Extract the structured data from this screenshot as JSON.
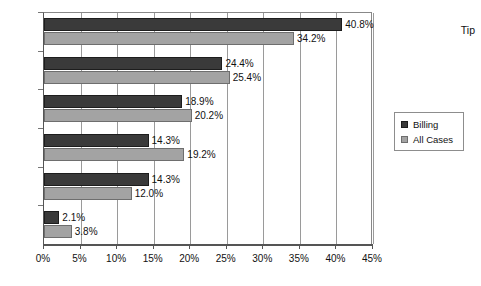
{
  "chart_data": {
    "type": "bar",
    "orientation": "horizontal",
    "title": "",
    "xlabel": "",
    "ylabel": "",
    "xlim": [
      0,
      45
    ],
    "xticks": [
      "0%",
      "5%",
      "10%",
      "15%",
      "20%",
      "25%",
      "30%",
      "35%",
      "40%",
      "45%"
    ],
    "xtick_values": [
      0,
      5,
      10,
      15,
      20,
      25,
      30,
      35,
      40,
      45
    ],
    "grid": true,
    "grid_axis": "x",
    "legend_position": "right",
    "categories": [
      "Tip",
      "",
      "",
      "",
      "",
      ""
    ],
    "series": [
      {
        "name": "Billing",
        "color": "#3a3a3a",
        "values": [
          40.8,
          24.4,
          18.9,
          14.3,
          14.3,
          2.1
        ],
        "labels": [
          "40.8%",
          "24.4%",
          "18.9%",
          "14.3%",
          "14.3%",
          "2.1%"
        ]
      },
      {
        "name": "All Cases",
        "color": "#a3a3a3",
        "values": [
          34.2,
          25.4,
          20.2,
          19.2,
          12.0,
          3.8
        ],
        "labels": [
          "34.2%",
          "25.4%",
          "20.2%",
          "19.2%",
          "12.0%",
          "3.8%"
        ]
      }
    ]
  },
  "legend": {
    "items": [
      {
        "label": "Billing",
        "swatch": "billing-swatch"
      },
      {
        "label": "All Cases",
        "swatch": "all-cases-swatch"
      }
    ]
  }
}
